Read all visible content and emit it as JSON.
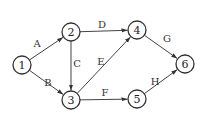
{
  "diagram": {
    "type": "directed-network",
    "nodes": [
      {
        "id": "1",
        "label": "1",
        "x": 22,
        "y": 65
      },
      {
        "id": "2",
        "label": "2",
        "x": 71,
        "y": 32
      },
      {
        "id": "3",
        "label": "3",
        "x": 71,
        "y": 100
      },
      {
        "id": "4",
        "label": "4",
        "x": 137,
        "y": 30
      },
      {
        "id": "5",
        "label": "5",
        "x": 137,
        "y": 99
      },
      {
        "id": "6",
        "label": "6",
        "x": 185,
        "y": 64
      }
    ],
    "edges": [
      {
        "from": "1",
        "to": "2",
        "label": "A",
        "lx": 37,
        "ly": 43
      },
      {
        "from": "1",
        "to": "3",
        "label": "B",
        "lx": 48,
        "ly": 82
      },
      {
        "from": "2",
        "to": "3",
        "label": "C",
        "lx": 77,
        "ly": 63
      },
      {
        "from": "2",
        "to": "4",
        "label": "D",
        "lx": 102,
        "ly": 24
      },
      {
        "from": "3",
        "to": "4",
        "label": "E",
        "lx": 101,
        "ly": 61
      },
      {
        "from": "3",
        "to": "5",
        "label": "F",
        "lx": 105,
        "ly": 92
      },
      {
        "from": "4",
        "to": "6",
        "label": "G",
        "lx": 167,
        "ly": 38
      },
      {
        "from": "5",
        "to": "6",
        "label": "H",
        "lx": 155,
        "ly": 81
      }
    ]
  },
  "style": {
    "stroke": "#444444",
    "node_radius": 9
  }
}
